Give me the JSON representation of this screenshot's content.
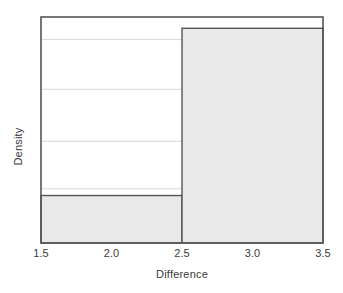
{
  "chart_data": {
    "type": "bar",
    "title": "",
    "subtitle": "",
    "xlabel": "Difference",
    "ylabel": "Density",
    "xlim": [
      1.5,
      3.5
    ],
    "ylim": [
      0,
      1.0
    ],
    "xticks": [
      "1.5",
      "2.0",
      "2.5",
      "3.0",
      "3.5"
    ],
    "xtick_values": [
      1.5,
      2.0,
      2.5,
      3.0,
      3.5
    ],
    "yticks": [],
    "ytick_values": [],
    "grid": "horizontal",
    "gridline_values": [
      0.9,
      0.68,
      0.45,
      0.24
    ],
    "legend": null,
    "bin_edges": [
      1.5,
      2.5,
      3.5
    ],
    "categories": [
      "1.5-2.5",
      "2.5-3.5"
    ],
    "values": [
      0.21,
      0.95
    ],
    "bar_fill": "#e9e9e9",
    "bar_edge": "#555555",
    "frame_color": "#555555",
    "gridline_color": "#d8d8d8",
    "text_color": "#3a3a3a",
    "background": "#ffffff"
  }
}
